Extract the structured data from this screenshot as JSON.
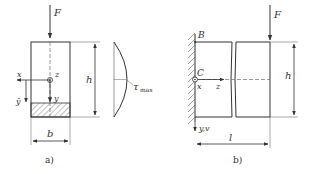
{
  "figure_a": {
    "caption": "a)",
    "force_label": "F",
    "x_label": "x",
    "z_label": "z",
    "y_label": "y",
    "ybar_label": "ȳ",
    "height_label": "h",
    "width_label": "b",
    "stress_label": "τ",
    "stress_sub": "max"
  },
  "figure_b": {
    "caption": "b)",
    "force_label": "F",
    "point_b": "B",
    "point_c": "C",
    "x_label": "x",
    "z_label": "z",
    "yv_label": "y,v",
    "height_label": "h",
    "length_label": "l"
  },
  "colors": {
    "stroke": "#333333",
    "hatch": "#666666",
    "background": "#ffffff"
  }
}
